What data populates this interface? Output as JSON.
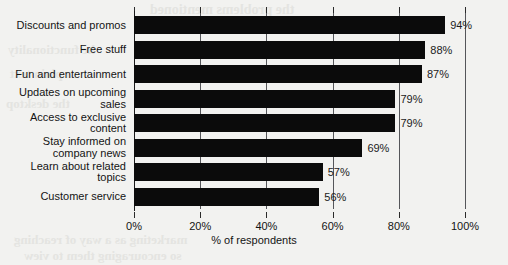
{
  "chart_data": {
    "type": "bar",
    "orientation": "horizontal",
    "title": "",
    "xlabel": "% of respondents",
    "ylabel": "",
    "xlim": [
      0,
      100
    ],
    "xticks": [
      0,
      20,
      40,
      60,
      80,
      100
    ],
    "xtick_labels": [
      "0%",
      "20%",
      "40%",
      "60%",
      "80%",
      "100%"
    ],
    "grid": true,
    "grid_axis": "x",
    "legend": false,
    "bar_color": "#0b0b0b",
    "categories": [
      "Discounts and promos",
      "Free stuff",
      "Fun and entertainment",
      "Updates on upcoming sales",
      "Access to exclusive content",
      "Stay informed on company news",
      "Learn about related topics",
      "Customer service"
    ],
    "values": [
      94,
      88,
      87,
      79,
      79,
      69,
      57,
      56
    ],
    "value_labels": [
      "94%",
      "88%",
      "87%",
      "79%",
      "79%",
      "69%",
      "57%",
      "56%"
    ]
  },
  "category_label_lines": [
    [
      "Discounts and promos"
    ],
    [
      "Free stuff"
    ],
    [
      "Fun and entertainment"
    ],
    [
      "Updates on upcoming",
      "sales"
    ],
    [
      "Access to exclusive",
      "content"
    ],
    [
      "Stay informed on",
      "company news"
    ],
    [
      "Learn about related",
      "topics"
    ],
    [
      "Customer service"
    ]
  ],
  "bleed_through_text": [
    "the problems mentioned",
    "he functionality",
    "a plain text",
    "the desktop",
    "marketing as a way of reaching",
    "so encouraging them to view"
  ]
}
